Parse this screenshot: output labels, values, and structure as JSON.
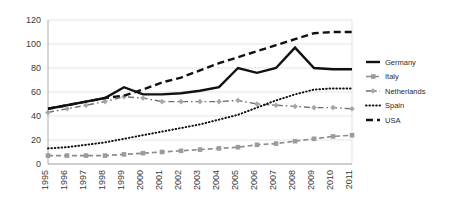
{
  "chart_data": {
    "type": "line",
    "title": "",
    "xlabel": "",
    "ylabel": "",
    "ylim": [
      0,
      120
    ],
    "yticks": [
      0,
      20,
      40,
      60,
      80,
      100,
      120
    ],
    "grid": true,
    "legend_position": "right",
    "categories": [
      "1995",
      "1996",
      "1997",
      "1998",
      "1999",
      "2000",
      "2001",
      "2002",
      "2003",
      "2004",
      "2005",
      "2006",
      "2007",
      "2008",
      "2009",
      "2010",
      "2011"
    ],
    "series": [
      {
        "name": "Germany",
        "style": "solid-thick-black",
        "color": "#111111",
        "values": [
          46,
          49,
          52,
          55,
          64,
          58,
          58,
          59,
          61,
          64,
          80,
          76,
          80,
          97,
          80,
          79,
          79
        ]
      },
      {
        "name": "Italy",
        "style": "dashed-gray-markers",
        "color": "#8c8c8c",
        "values": [
          7,
          7,
          7,
          7,
          8,
          9,
          10,
          11,
          12,
          13,
          14,
          16,
          17,
          19,
          21,
          23,
          24
        ]
      },
      {
        "name": "Netherlands",
        "style": "dash-dot-gray-markers",
        "color": "#6e6e6e",
        "values": [
          43,
          46,
          49,
          52,
          56,
          55,
          52,
          52,
          52,
          52,
          53,
          50,
          49,
          48,
          47,
          47,
          46
        ]
      },
      {
        "name": "Spain",
        "style": "dotted-black",
        "color": "#111111",
        "values": [
          13,
          14,
          16,
          18,
          21,
          24,
          27,
          30,
          33,
          37,
          41,
          47,
          53,
          58,
          62,
          63,
          63
        ]
      },
      {
        "name": "USA",
        "style": "dashed-thick-black",
        "color": "#111111",
        "values": [
          46,
          49,
          52,
          55,
          57,
          62,
          68,
          72,
          78,
          84,
          89,
          94,
          99,
          104,
          109,
          110,
          110
        ]
      }
    ]
  },
  "legend": {
    "items": [
      {
        "label": "Germany"
      },
      {
        "label": "Italy"
      },
      {
        "label": "Netherlands"
      },
      {
        "label": "Spain"
      },
      {
        "label": "USA"
      }
    ]
  }
}
